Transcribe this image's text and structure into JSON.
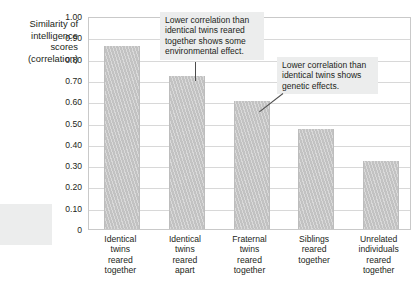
{
  "chart_data": {
    "type": "bar",
    "title": "",
    "xlabel": "",
    "ylabel": "Similarity of intelligence scores (correlation)",
    "ylabel_lines": [
      "Similarity of",
      "intelligence",
      "scores",
      "(correlation)"
    ],
    "categories": [
      "Identical twins reared together",
      "Identical twins reared apart",
      "Fraternal twins reared together",
      "Siblings reared together",
      "Unrelated individuals reared together"
    ],
    "category_lines": [
      [
        "Identical",
        "twins",
        "reared",
        "together"
      ],
      [
        "Identical",
        "twins",
        "reared",
        "apart"
      ],
      [
        "Fraternal",
        "twins",
        "reared",
        "together"
      ],
      [
        "Siblings",
        "reared",
        "together"
      ],
      [
        "Unrelated",
        "individuals",
        "reared",
        "together"
      ]
    ],
    "values": [
      0.86,
      0.72,
      0.6,
      0.47,
      0.32
    ],
    "ylim": [
      0,
      1.0
    ],
    "ytick_labels": [
      "1.00",
      "0.90",
      "0.80",
      "0.70",
      "0.60",
      "0.50",
      "0.40",
      "0.30",
      "0.20",
      "0.10",
      "0"
    ],
    "ytick_values": [
      1.0,
      0.9,
      0.8,
      0.7,
      0.6,
      0.5,
      0.4,
      0.3,
      0.2,
      0.1,
      0
    ],
    "grid": true,
    "legend": "none",
    "bar_color": "#c2c2c2",
    "grid_color": "#d8d8d8",
    "annotations": [
      {
        "id": "environmental",
        "text": "Lower correlation than identical twins reared together shows some environmental effect.",
        "lines": [
          "Lower correlation than",
          "identical twins reared",
          "together shows some",
          "environmental effect."
        ],
        "points_to": "Identical twins reared apart"
      },
      {
        "id": "genetic",
        "text": "Lower correlation than identical twins shows genetic effects.",
        "lines": [
          "Lower correlation than",
          "identical twins shows",
          "genetic effects."
        ],
        "points_to": "Fraternal twins reared together"
      },
      {
        "id": "note",
        "text": "The most ce scores. cates no",
        "lines": [
          "The most",
          "ce scores.",
          "cates no"
        ],
        "clipped": true
      }
    ]
  }
}
